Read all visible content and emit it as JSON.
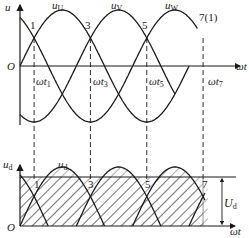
{
  "diagram": {
    "upper_plot": {
      "y_axis_label": "u",
      "x_axis_label": "ωt",
      "origin_label": "O",
      "curves": [
        {
          "name": "u_U",
          "label_main": "u",
          "label_sub": "U",
          "phase_deg": 0
        },
        {
          "name": "u_V",
          "label_main": "u",
          "label_sub": "V",
          "phase_deg": -120
        },
        {
          "name": "u_W",
          "label_main": "u",
          "label_sub": "W",
          "phase_deg": -240
        }
      ],
      "crossing_points": [
        {
          "label": "1",
          "angle_deg": 30
        },
        {
          "label": "3",
          "angle_deg": 150
        },
        {
          "label": "5",
          "angle_deg": 270
        },
        {
          "label": "7(1)",
          "angle_deg": 390
        }
      ],
      "time_ticks": [
        {
          "main": "ωt",
          "sub": "1"
        },
        {
          "main": "ωt",
          "sub": "3"
        },
        {
          "main": "ωt",
          "sub": "5"
        },
        {
          "main": "ωt",
          "sub": "7"
        }
      ]
    },
    "lower_plot": {
      "y_axis_label_main": "u",
      "y_axis_label_sub": "d",
      "x_axis_label": "ωt",
      "origin_label": "O",
      "curve_label_main": "u",
      "curve_label_sub": "d",
      "crossing_labels": [
        "1",
        "3",
        "5",
        "7"
      ],
      "average_label_main": "U",
      "average_label_sub": "d",
      "fill_pattern": "diagonal-hatch"
    }
  }
}
